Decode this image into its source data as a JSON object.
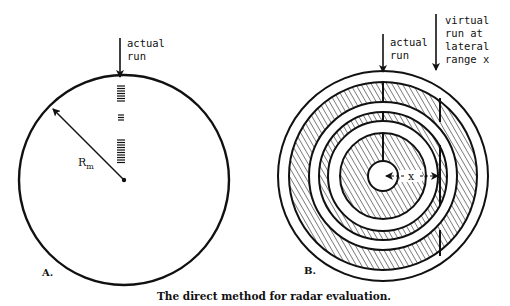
{
  "figure": {
    "caption": "The direct method for radar evaluation.",
    "panel_a": {
      "label": "A.",
      "arrow_label_line1": "actual",
      "arrow_label_line2": "run",
      "radius_label_main": "R",
      "radius_label_sub": "m"
    },
    "panel_b": {
      "label": "B.",
      "actual_label_line1": "actual",
      "actual_label_line2": "run",
      "virtual_label_line1": "virtual",
      "virtual_label_line2": "run at",
      "virtual_label_line3": "lateral",
      "virtual_label_line4": "range x",
      "distance_label": "x"
    },
    "colors": {
      "ink": "#111111",
      "background": "#ffffff"
    }
  }
}
